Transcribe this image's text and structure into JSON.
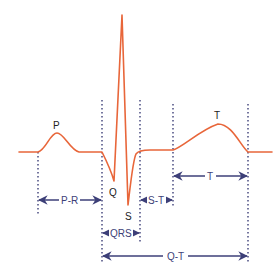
{
  "diagram": {
    "colors": {
      "wave": "#e8663a",
      "interval": "#3d3f78",
      "text": "#222222"
    },
    "wave_labels": {
      "p": "P",
      "q": "Q",
      "s": "S",
      "t": "T"
    },
    "interval_labels": {
      "pr": "P-R",
      "st": "S-T",
      "t": "T",
      "qrs": "QRS",
      "qt": "Q-T"
    }
  }
}
